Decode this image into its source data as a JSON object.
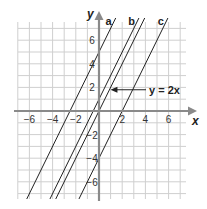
{
  "chart_data": {
    "type": "line",
    "title": "",
    "xlabel": "x",
    "ylabel": "y",
    "xlim": [
      -7,
      7
    ],
    "ylim": [
      -7.5,
      7.6
    ],
    "grid": true,
    "x_ticks": [
      -6,
      -4,
      -2,
      2,
      4,
      6
    ],
    "y_ticks": [
      6,
      4,
      2,
      -2,
      -4,
      -6
    ],
    "x_tick_labels": [
      "−6",
      "−4",
      "−2",
      "2",
      "4",
      "6"
    ],
    "y_tick_labels": [
      "6",
      "4",
      "2",
      "−2",
      "−4",
      "−6"
    ],
    "series": [
      {
        "name": "a",
        "label": "a",
        "slope": 2,
        "intercept": 5
      },
      {
        "name": "b",
        "label": "b",
        "slope": 2,
        "intercept": 1
      },
      {
        "name": "y=2x",
        "label": "",
        "slope": 2,
        "intercept": 0
      },
      {
        "name": "c",
        "label": "c",
        "slope": 2,
        "intercept": -4
      }
    ],
    "annotations": [
      {
        "text": "y = 2x",
        "points_to": "y=2x",
        "at": [
          0.9,
          1.8
        ]
      }
    ]
  }
}
